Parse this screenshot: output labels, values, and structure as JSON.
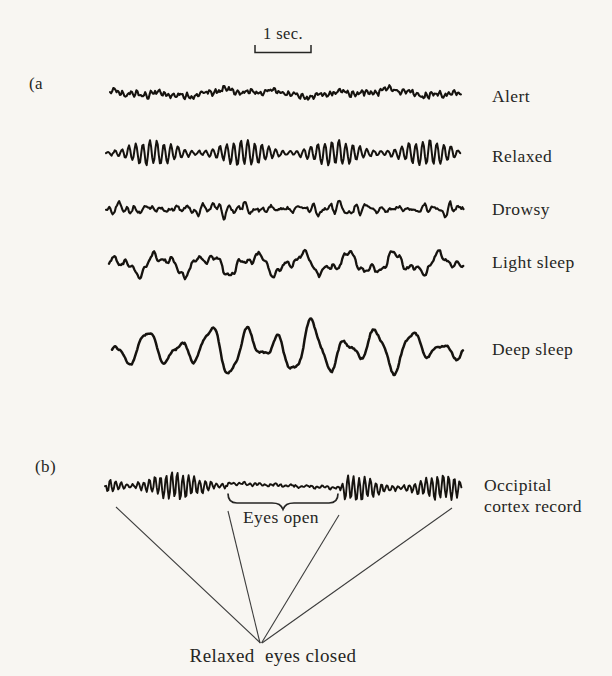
{
  "colors": {
    "background": "#f8f6f2",
    "ink": "#262624",
    "trace": "#16130f",
    "annotation_line": "#3c3c3c"
  },
  "scale_bar": {
    "label": "1 sec."
  },
  "panel_a_tag": "(a",
  "panel_b_tag": "(b)",
  "traces": [
    {
      "label": "Alert",
      "type": "beta",
      "y": 93,
      "x0": 110,
      "x1": 462,
      "amp": 3.2,
      "stroke": 2.1
    },
    {
      "label": "Relaxed",
      "type": "alpha",
      "y": 153,
      "x0": 106,
      "x1": 461,
      "amp": 12,
      "stroke": 2.0
    },
    {
      "label": "Drowsy",
      "type": "theta",
      "y": 209,
      "x0": 106,
      "x1": 464,
      "amp": 7.5,
      "stroke": 2.1
    },
    {
      "label": "Light sleep",
      "type": "slow",
      "y": 264,
      "x0": 109,
      "x1": 464,
      "amp": 10.5,
      "stroke": 2.3
    },
    {
      "label": "Deep sleep",
      "type": "delta",
      "y": 349,
      "x0": 112,
      "x1": 464,
      "amp": 21,
      "stroke": 2.5
    },
    {
      "label": "Occipital\ncortex record",
      "type": "occipital",
      "y": 486,
      "x0": 105,
      "x1": 462,
      "amp": 13,
      "stroke": 1.9,
      "segments": [
        {
          "x0": 105,
          "x1": 228,
          "type": "alphaB",
          "amp": 13,
          "dy0": 0,
          "dy1": 0
        },
        {
          "x0": 228,
          "x1": 340,
          "type": "flat",
          "amp": 1.8,
          "dy0": -3,
          "dy1": 2
        },
        {
          "x0": 340,
          "x1": 462,
          "type": "alphaB",
          "amp": 12,
          "dy0": 3,
          "dy1": 1
        }
      ]
    }
  ],
  "annotations": {
    "eyes_open": "Eyes open",
    "converge": "Relaxed  eyes closed"
  }
}
